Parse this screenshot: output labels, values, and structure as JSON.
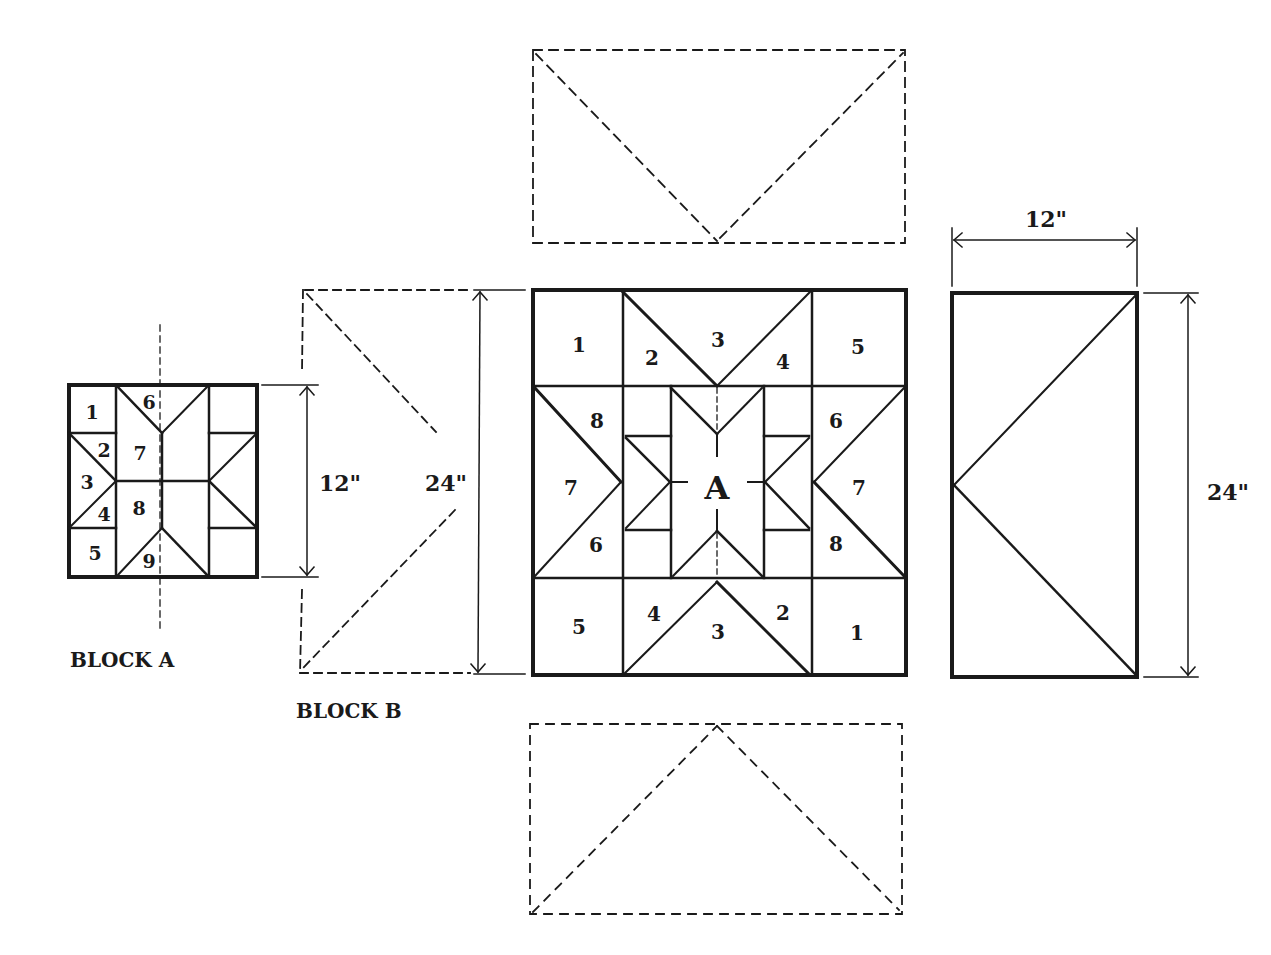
{
  "colors": {
    "ink": "#1a1a1a",
    "paper": "#ffffff"
  },
  "block_a": {
    "title": "BLOCK A",
    "dimension": "12\"",
    "pieces": [
      "1",
      "2",
      "3",
      "4",
      "5",
      "6",
      "7",
      "8",
      "9"
    ]
  },
  "block_b": {
    "title": "BLOCK B",
    "dimension": "24\""
  },
  "main_block": {
    "center_label": "A",
    "top_row": [
      "1",
      "2",
      "3",
      "4",
      "5"
    ],
    "middle_left": [
      "8",
      "7",
      "6"
    ],
    "middle_right": [
      "6",
      "7",
      "8"
    ],
    "bottom_row": [
      "5",
      "4",
      "3",
      "2",
      "1"
    ]
  },
  "side_panel": {
    "width": "12\"",
    "height": "24\""
  }
}
